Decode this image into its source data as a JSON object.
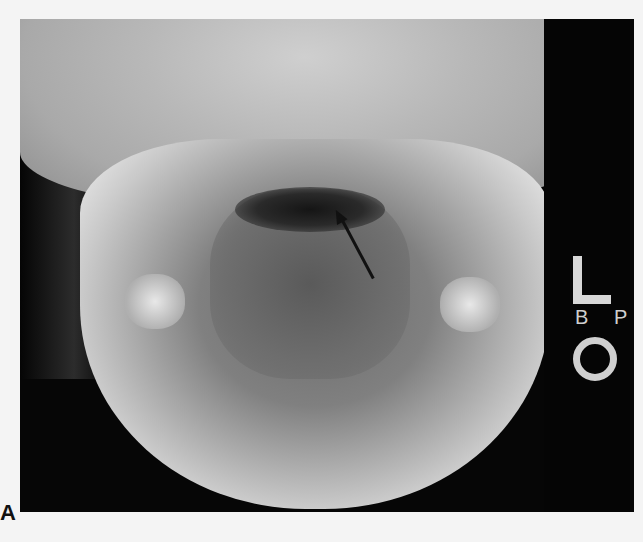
{
  "image": {
    "description": "Frontal (AP open-mouth) radiograph of skull and mandible with arrow indicating structure near dens",
    "panel_label": "A",
    "markers": {
      "side_letter": "L",
      "small_text": "B P",
      "circle_marker": "O"
    },
    "annotation": {
      "type": "arrow",
      "color": "#111111"
    }
  }
}
